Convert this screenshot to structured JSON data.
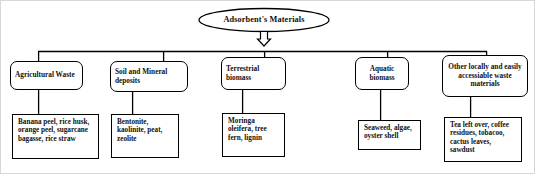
{
  "figure": {
    "root": {
      "label": "Adsorbent's Materials",
      "shape": "ellipse"
    },
    "arrow": {
      "name": "down-arrow-icon",
      "direction": "down"
    },
    "categories": [
      {
        "id": "agricultural-waste",
        "label": "Agricultural Waste",
        "examples": "Banana peel, rice husk, orange peel, sugarcane bagasse, rice straw"
      },
      {
        "id": "soil-and-mineral-deposits",
        "label": "Soil and Mineral deposits",
        "examples": "Bentonite, kaolinite, peat, zeolite"
      },
      {
        "id": "terrestrial-biomass",
        "label": "Terrestrial biomass",
        "examples": "Moringa oleifera, tree fern, lignin"
      },
      {
        "id": "aquatic-biomass",
        "label": "Aquatic biomass",
        "examples": "Seaweed, algae, oyster shell"
      },
      {
        "id": "other-locally-accessible-waste",
        "label": "Other locally and easily accessiable waste materials",
        "examples": "Tea left over, coffee residues, tobacoo, cactus leaves, sawdust"
      }
    ],
    "colors": {
      "line": "#000000",
      "text": "#111111",
      "background": "#ffffff"
    }
  }
}
